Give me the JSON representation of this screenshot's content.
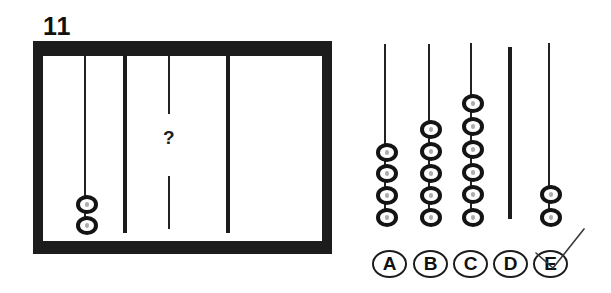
{
  "question": {
    "number": "11",
    "missing_marker": "?",
    "frame": {
      "rods": [
        {
          "position": "left",
          "beads": 2
        },
        {
          "position": "middle",
          "beads": null,
          "hidden": true
        },
        {
          "position": "right",
          "beads": 0,
          "rod_visible": false
        }
      ]
    }
  },
  "options": [
    {
      "label": "A",
      "beads": 4
    },
    {
      "label": "B",
      "beads": 5
    },
    {
      "label": "C",
      "beads": 6
    },
    {
      "label": "D",
      "beads": 0,
      "thick_rod": true
    },
    {
      "label": "E",
      "beads": 2,
      "checked": true
    }
  ],
  "colors": {
    "ink": "#1c1c1c",
    "background": "#ffffff"
  }
}
